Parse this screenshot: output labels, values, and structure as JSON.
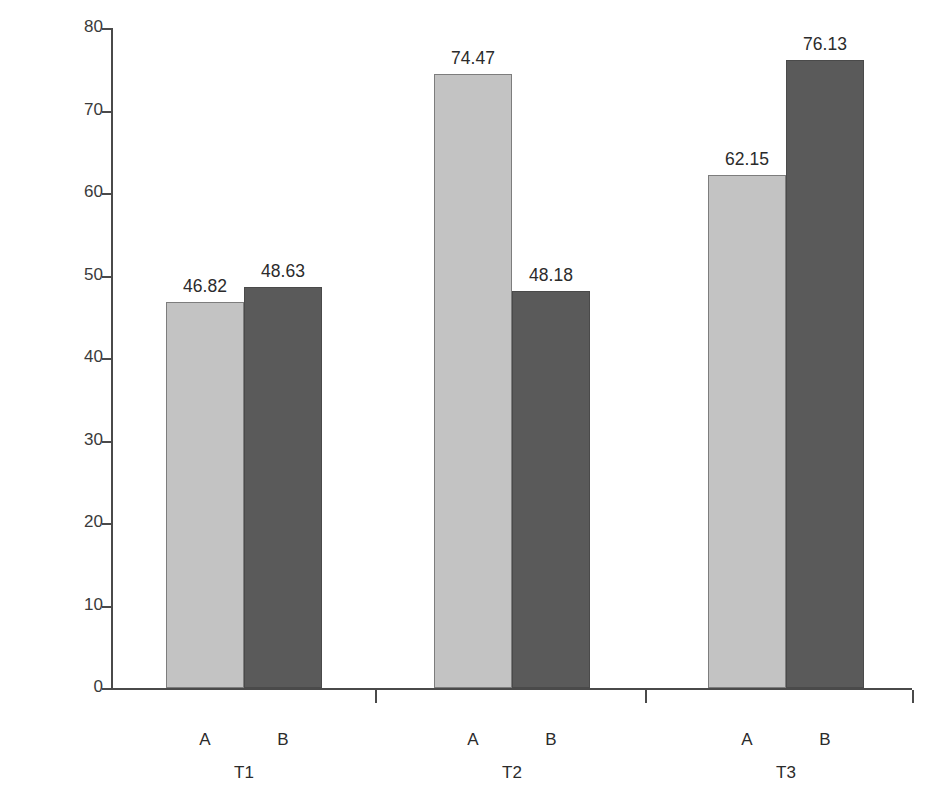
{
  "chart_data": {
    "type": "bar",
    "title": "",
    "xlabel": "",
    "ylabel": "% Success",
    "ylim": [
      0,
      80
    ],
    "yticks": [
      0,
      10,
      20,
      30,
      40,
      50,
      60,
      70,
      80
    ],
    "ytick_labels": [
      "0",
      "10",
      "20",
      "30",
      "40",
      "50",
      "60",
      "70",
      "80"
    ],
    "grid": false,
    "legend": "none",
    "categories": [
      "T1",
      "T2",
      "T3"
    ],
    "series": [
      {
        "name": "A",
        "label": "A",
        "color": "#c3c3c3",
        "values": [
          46.82,
          74.47,
          62.15
        ]
      },
      {
        "name": "B",
        "label": "B",
        "color": "#5a5a5a",
        "values": [
          48.63,
          48.18,
          76.13
        ]
      }
    ],
    "data_labels": [
      [
        "46.82",
        "48.63"
      ],
      [
        "74.47",
        "48.18"
      ],
      [
        "62.15",
        "76.13"
      ]
    ],
    "groups": [
      {
        "label": "T1",
        "bars": [
          {
            "series": "A",
            "label": "A",
            "value": 46.82,
            "value_label": "46.82",
            "color": "#c3c3c3"
          },
          {
            "series": "B",
            "label": "B",
            "value": 48.63,
            "value_label": "48.63",
            "color": "#5a5a5a"
          }
        ]
      },
      {
        "label": "T2",
        "bars": [
          {
            "series": "A",
            "label": "A",
            "value": 74.47,
            "value_label": "74.47",
            "color": "#c3c3c3"
          },
          {
            "series": "B",
            "label": "B",
            "value": 48.18,
            "value_label": "48.18",
            "color": "#5a5a5a"
          }
        ]
      },
      {
        "label": "T3",
        "bars": [
          {
            "series": "A",
            "label": "A",
            "value": 62.15,
            "value_label": "62.15",
            "color": "#c3c3c3"
          },
          {
            "series": "B",
            "label": "B",
            "value": 76.13,
            "value_label": "76.13",
            "color": "#5a5a5a"
          }
        ]
      }
    ]
  },
  "layout": {
    "plot_left": 111,
    "plot_top": 28,
    "plot_width": 801,
    "plot_height": 662,
    "bar_width": 78,
    "group_starts": [
      55,
      323,
      597
    ],
    "group_ticks": [
      264,
      534,
      801
    ]
  }
}
